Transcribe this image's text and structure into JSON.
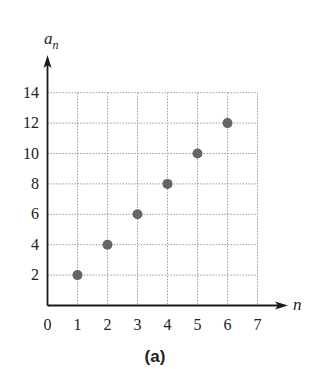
{
  "chart_data": {
    "type": "scatter",
    "title": "",
    "caption": "(a)",
    "xlabel": "n",
    "ylabel": "a_n",
    "ylabel_main": "a",
    "ylabel_sub": "n",
    "xlim": [
      0,
      7
    ],
    "ylim": [
      0,
      14
    ],
    "x_ticks": [
      0,
      1,
      2,
      3,
      4,
      5,
      6,
      7
    ],
    "y_ticks": [
      2,
      4,
      6,
      8,
      10,
      12,
      14
    ],
    "grid": true,
    "grid_style": "dotted",
    "legend": null,
    "series": [
      {
        "name": "a_n",
        "x": [
          1,
          2,
          3,
          4,
          5,
          6
        ],
        "y": [
          2,
          4,
          6,
          8,
          10,
          12
        ],
        "marker_color": "#666666"
      }
    ]
  },
  "colors": {
    "axis": "#1a1a1a",
    "grid": "#9a9a9a",
    "point": "#666666",
    "text": "#222222"
  }
}
